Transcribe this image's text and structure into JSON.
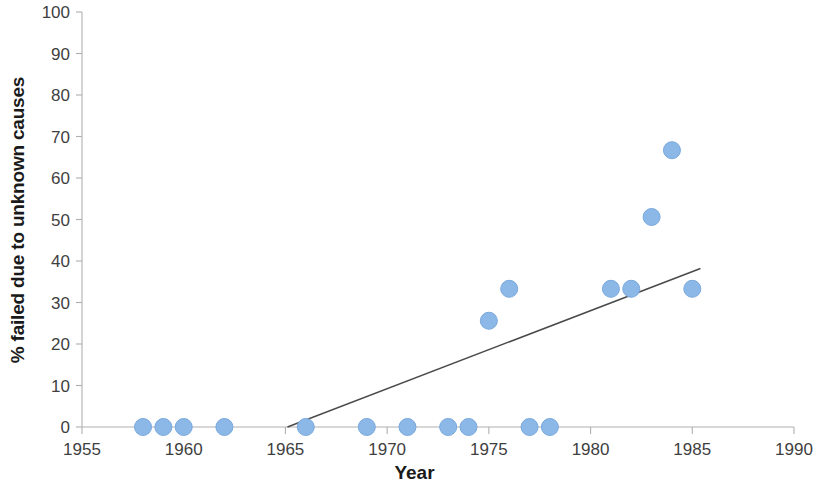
{
  "chart_data": {
    "type": "scatter",
    "title": "",
    "xlabel": "Year",
    "ylabel": "% failed due to unknown causes",
    "xlim": [
      1955,
      1990
    ],
    "ylim": [
      0,
      100
    ],
    "xticks": [
      "1955",
      "1960",
      "1965",
      "1970",
      "1975",
      "1980",
      "1985",
      "1990"
    ],
    "xtick_values": [
      1955,
      1960,
      1965,
      1970,
      1975,
      1980,
      1985,
      1990
    ],
    "yticks": [
      "0",
      "10",
      "20",
      "30",
      "40",
      "50",
      "60",
      "70",
      "80",
      "90",
      "100"
    ],
    "ytick_values": [
      0,
      10,
      20,
      30,
      40,
      50,
      60,
      70,
      80,
      90,
      100
    ],
    "grid": false,
    "legend": "none",
    "marker_color": "#8cb8e8",
    "marker_edge_color": "#79a8dd",
    "marker_size": 17,
    "axis_color": "#b0b0b0",
    "trendline_color": "#4a4a4a",
    "series": [
      {
        "name": "% failed due to unknown causes",
        "points": [
          {
            "x": 1958,
            "y": 0
          },
          {
            "x": 1959,
            "y": 0
          },
          {
            "x": 1960,
            "y": 0
          },
          {
            "x": 1962,
            "y": 0
          },
          {
            "x": 1966,
            "y": 0
          },
          {
            "x": 1969,
            "y": 0
          },
          {
            "x": 1971,
            "y": 0
          },
          {
            "x": 1973,
            "y": 0
          },
          {
            "x": 1974,
            "y": 0
          },
          {
            "x": 1975,
            "y": 25.6
          },
          {
            "x": 1976,
            "y": 33.3
          },
          {
            "x": 1977,
            "y": 0
          },
          {
            "x": 1978,
            "y": 0
          },
          {
            "x": 1981,
            "y": 33.3
          },
          {
            "x": 1982,
            "y": 33.3
          },
          {
            "x": 1983,
            "y": 50.6
          },
          {
            "x": 1984,
            "y": 66.7
          },
          {
            "x": 1985,
            "y": 33.3
          }
        ]
      }
    ],
    "trendline": {
      "type": "linear",
      "x_start": 1965.1,
      "y_start": 0,
      "x_end": 1985.4,
      "y_end": 38.2
    }
  }
}
